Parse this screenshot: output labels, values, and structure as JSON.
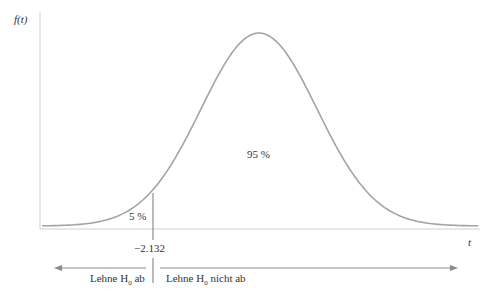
{
  "chart_data": {
    "type": "area",
    "title": "",
    "ylabel": "f(t)",
    "xlabel": "t",
    "distribution": "t-distribution (symmetric bell curve)",
    "critical_value": -2.132,
    "critical_value_label": "−2.132",
    "regions": [
      {
        "name": "rejection",
        "area_label": "5 %",
        "range": "t < -2.132",
        "decision": "Lehne H0 ab"
      },
      {
        "name": "acceptance",
        "area_label": "95 %",
        "range": "t >= -2.132",
        "decision": "Lehne H0 nicht ab"
      }
    ],
    "grid": false,
    "legend": "none"
  },
  "labels": {
    "y_axis": "f(t)",
    "x_axis": "t",
    "left_area": "5 %",
    "main_area": "95 %",
    "critical": "−2.132",
    "reject_prefix": "Lehne H",
    "reject_sub": "0",
    "reject_suffix": " ab",
    "accept_prefix": "Lehne H",
    "accept_sub": "0",
    "accept_suffix": " nicht ab"
  },
  "colors": {
    "axis": "#c8c8c8",
    "curve": "#a0a0a0",
    "arrow": "#8a8a8a",
    "text": "#333333"
  }
}
